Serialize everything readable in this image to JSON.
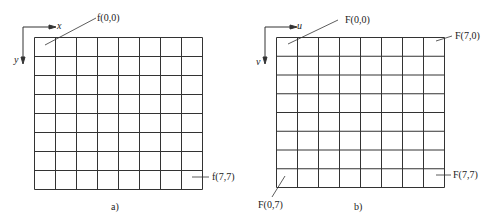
{
  "panels": [
    {
      "id": "a",
      "caption": "a)",
      "axis_h": "x",
      "axis_v": "y",
      "grid": {
        "rows": 8,
        "cols": 8
      },
      "labels": {
        "top_left": "f(0,0)",
        "bottom_right": "f(7,7)"
      }
    },
    {
      "id": "b",
      "caption": "b)",
      "axis_h": "u",
      "axis_v": "v",
      "grid": {
        "rows": 8,
        "cols": 8
      },
      "labels": {
        "top_left": "F(0,0)",
        "top_right": "F(7,0)",
        "bottom_right": "F(7,7)",
        "bottom_left": "F(0,7)"
      }
    }
  ],
  "colors": {
    "line": "#333333",
    "background": "#ffffff"
  }
}
